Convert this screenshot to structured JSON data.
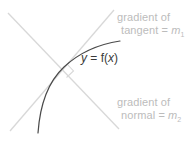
{
  "diagram": {
    "colors": {
      "curve": "#4a4a4a",
      "line": "#d8d8d8",
      "annotation_text": "#bcbcbc",
      "function_text": "#3a3a3a",
      "background": "#ffffff"
    },
    "curve": {
      "label_y": "y",
      "label_equals": " = f(",
      "label_var": "x",
      "label_close": ")",
      "full_label": "y = f(x)"
    },
    "annotations": {
      "tangent": {
        "line1": "gradient of",
        "line2_prefix": "tangent = ",
        "line2_symbol": "m",
        "line2_subscript": "1"
      },
      "normal": {
        "line1": "gradient of",
        "line2_prefix": "normal = ",
        "line2_symbol": "m",
        "line2_subscript": "2"
      }
    },
    "geometry": {
      "intersection_x": 67,
      "intersection_y": 70,
      "right_angle_marker": "perpendicular"
    }
  }
}
